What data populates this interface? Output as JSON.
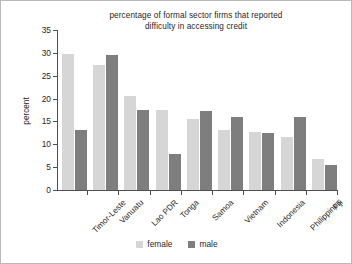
{
  "chart_data": {
    "type": "bar",
    "title": "percentage of formal sector firms that reported difficulty in accessing credit",
    "title_line1": "percentage of formal sector firms that reported",
    "title_line2": "difficulty in accessing credit",
    "xlabel": "",
    "ylabel": "percent",
    "ylim": [
      0,
      35
    ],
    "yticks": [
      0,
      5,
      10,
      15,
      20,
      25,
      30,
      35
    ],
    "grid": false,
    "legend_position": "bottom",
    "categories": [
      "Timor-Leste",
      "Vanuatu",
      "Lao PDR",
      "Tonga",
      "Samoa",
      "Vietnam",
      "Indonesia",
      "Philippines",
      "Fiji"
    ],
    "series": [
      {
        "name": "female",
        "color": "#d6d6d6",
        "values": [
          29.8,
          27.3,
          20.5,
          17.5,
          15.6,
          13.1,
          12.8,
          11.7,
          6.7
        ]
      },
      {
        "name": "male",
        "color": "#7e7e7e",
        "values": [
          13.1,
          29.5,
          17.6,
          7.8,
          17.3,
          16.0,
          12.4,
          16.0,
          5.4
        ]
      }
    ]
  },
  "legend": {
    "items": [
      {
        "label": "female"
      },
      {
        "label": "male"
      }
    ]
  },
  "colors": {
    "female": "#d6d6d6",
    "male": "#7e7e7e",
    "axis": "#4f4f4f",
    "text": "#2a2626",
    "background": "#ffffff",
    "border": "#b9b9b9"
  }
}
